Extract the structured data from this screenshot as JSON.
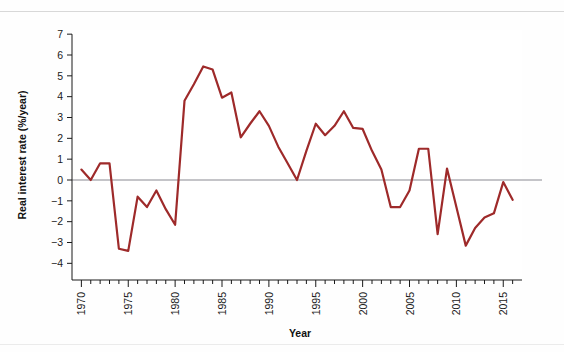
{
  "figure": {
    "background_color": "#fefefe",
    "rule_color": "#d8d8d8"
  },
  "chart_data": {
    "type": "line",
    "title": "",
    "xlabel": "Year",
    "ylabel": "Real interest rate (%/year)",
    "xlim": [
      1969,
      2017
    ],
    "ylim": [
      -4.8,
      7.2
    ],
    "yticks": [
      7,
      6,
      5,
      4,
      3,
      2,
      1,
      0,
      -1,
      -2,
      -3,
      -4
    ],
    "ytick_labels": [
      "7",
      "6",
      "5",
      "4",
      "3",
      "2",
      "1",
      "0",
      "−1",
      "−2",
      "−3",
      "−4"
    ],
    "xticks": [
      1970,
      1975,
      1980,
      1985,
      1990,
      1995,
      2000,
      2005,
      2010,
      2015
    ],
    "xtick_labels": [
      "1970",
      "1975",
      "1980",
      "1985",
      "1990",
      "1995",
      "2000",
      "2005",
      "2010",
      "2015"
    ],
    "x_minor_tick_interval": 1,
    "grid": false,
    "legend": false,
    "zero_line": true,
    "zero_line_color": "#8a8a92",
    "series": [
      {
        "name": "Real interest rate",
        "color": "#9e2a2a",
        "line_width": 2.2,
        "x": [
          1970,
          1971,
          1972,
          1973,
          1974,
          1975,
          1976,
          1977,
          1978,
          1979,
          1980,
          1981,
          1982,
          1983,
          1984,
          1985,
          1986,
          1987,
          1988,
          1989,
          1990,
          1991,
          1992,
          1993,
          1994,
          1995,
          1996,
          1997,
          1998,
          1999,
          2000,
          2001,
          2002,
          2003,
          2004,
          2005,
          2006,
          2007,
          2008,
          2009,
          2010,
          2011,
          2012,
          2013,
          2014,
          2015,
          2016
        ],
        "values": [
          0.5,
          0.0,
          0.8,
          0.8,
          -3.3,
          -3.4,
          -0.8,
          -1.3,
          -0.5,
          -1.4,
          -2.15,
          3.8,
          4.6,
          5.45,
          5.3,
          3.95,
          4.2,
          2.05,
          2.7,
          3.3,
          2.6,
          1.6,
          0.8,
          0.0,
          1.4,
          2.7,
          2.15,
          2.6,
          3.3,
          2.5,
          2.45,
          1.4,
          0.5,
          -1.3,
          -1.3,
          -0.5,
          1.5,
          1.5,
          -2.6,
          0.55,
          -1.3,
          -3.15,
          -2.3,
          -1.8,
          -1.6,
          -0.1,
          -0.95
        ]
      }
    ]
  },
  "axes": {
    "y_axis_label": "Real interest rate (%/year)",
    "x_axis_label": "Year"
  }
}
